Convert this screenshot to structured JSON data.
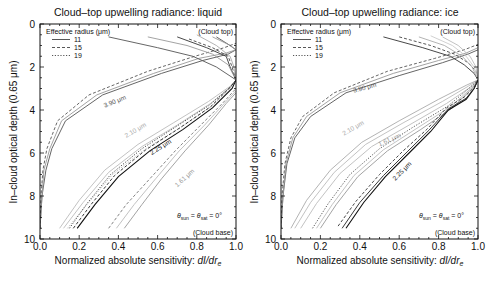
{
  "chart_data": [
    {
      "type": "line",
      "title": "Cloud–top upwelling radiance: liquid",
      "xlabel": "Normalized absolute sensitivity: dI/dr",
      "xlabel_italic_suffix": "dI/dr",
      "xlabel_subscript": "e",
      "ylabel": "In–cloud optical depth (0.65 μm)",
      "xlim": [
        0,
        1.0
      ],
      "ylim": [
        10,
        0
      ],
      "y_inverted": true,
      "xticks": [
        "0.0",
        "0.2",
        "0.4",
        "0.6",
        "0.8",
        "1.0"
      ],
      "yticks": [
        "0",
        "2",
        "4",
        "6",
        "8",
        "10"
      ],
      "grid": false,
      "legend": {
        "title": "Effective radius (μm)",
        "position": "upper-left",
        "entries": [
          {
            "label": "11",
            "style": "solid"
          },
          {
            "label": "15",
            "style": "dashed"
          },
          {
            "label": "19",
            "style": "dotted"
          }
        ]
      },
      "annotations": {
        "top": "(Cloud top)",
        "base": "(Cloud base)",
        "angle": "θsun = θsat = 0°"
      },
      "series": [
        {
          "name": "3.90 μm r=11",
          "color": "#555555",
          "style": "solid",
          "label": "3.90 μm",
          "label_pos": [
            0.33,
            3.9
          ],
          "label_rot": -22,
          "x": [
            0.0,
            0.01,
            0.03,
            0.06,
            0.13,
            0.32,
            0.62,
            0.83,
            0.96,
            1.0,
            0.97,
            0.9
          ],
          "y": [
            9.5,
            8.0,
            6.8,
            5.8,
            4.5,
            3.3,
            2.3,
            1.7,
            1.4,
            1.2,
            1.0,
            0.6
          ]
        },
        {
          "name": "3.90 μm r=15",
          "color": "#999999",
          "style": "solid",
          "x": [
            0.0,
            0.01,
            0.02,
            0.05,
            0.11,
            0.29,
            0.58,
            0.81,
            0.95,
            1.0,
            0.96,
            0.88
          ],
          "y": [
            9.5,
            8.0,
            6.8,
            5.8,
            4.5,
            3.3,
            2.3,
            1.6,
            1.35,
            1.2,
            0.95,
            0.6
          ]
        },
        {
          "name": "3.90 μm r=19",
          "color": "#555555",
          "style": "dashed",
          "x": [
            0.0,
            0.005,
            0.015,
            0.035,
            0.09,
            0.25,
            0.55,
            0.79,
            0.94,
            1.0
          ],
          "y": [
            9.5,
            8.0,
            6.8,
            5.8,
            4.5,
            3.3,
            2.2,
            1.5,
            1.1,
            0.9
          ]
        },
        {
          "name": "2.10 μm r=11",
          "color": "#bbbbbb",
          "style": "solid",
          "label": "2.10 μm",
          "label_pos": [
            0.44,
            5.3
          ],
          "label_rot": -30,
          "x": [
            0.1,
            0.2,
            0.33,
            0.5,
            0.68,
            0.86,
            0.97,
            1.0
          ],
          "y": [
            9.5,
            8.2,
            6.8,
            5.6,
            4.6,
            3.6,
            2.9,
            2.6
          ]
        },
        {
          "name": "2.10 μm r=15",
          "color": "#bbbbbb",
          "style": "solid",
          "x": [
            0.12,
            0.22,
            0.35,
            0.52,
            0.7,
            0.87,
            0.97,
            1.0
          ],
          "y": [
            9.5,
            8.3,
            6.9,
            5.7,
            4.7,
            3.7,
            2.95,
            2.6
          ]
        },
        {
          "name": "2.10 μm r=19",
          "color": "#aaaaaa",
          "style": "dotted",
          "x": [
            0.14,
            0.24,
            0.37,
            0.54,
            0.72,
            0.88,
            0.97,
            1.0
          ],
          "y": [
            9.5,
            8.4,
            7.0,
            5.8,
            4.8,
            3.8,
            3.0,
            2.6
          ]
        },
        {
          "name": "2.25 μm r=11",
          "color": "#111111",
          "style": "solid",
          "label": "2.25 μm",
          "label_pos": [
            0.57,
            6.1
          ],
          "label_rot": -32,
          "x": [
            0.19,
            0.28,
            0.4,
            0.56,
            0.73,
            0.88,
            0.98,
            1.0
          ],
          "y": [
            9.5,
            8.4,
            7.1,
            5.9,
            4.9,
            3.9,
            3.0,
            2.6
          ]
        },
        {
          "name": "2.25 μm r=15",
          "color": "#222222",
          "style": "dashed",
          "x": [
            0.17,
            0.26,
            0.38,
            0.54,
            0.71,
            0.87,
            0.97,
            1.0
          ],
          "y": [
            9.5,
            8.4,
            7.05,
            5.85,
            4.85,
            3.85,
            2.95,
            2.6
          ]
        },
        {
          "name": "2.25 μm r=19",
          "color": "#333333",
          "style": "dotted",
          "x": [
            0.15,
            0.24,
            0.36,
            0.52,
            0.69,
            0.86,
            0.97,
            1.0
          ],
          "y": [
            9.5,
            8.35,
            7.0,
            5.8,
            4.8,
            3.8,
            2.95,
            2.6
          ]
        },
        {
          "name": "1.61 μm r=11",
          "color": "#999999",
          "style": "solid",
          "label": "1.61 μm",
          "label_pos": [
            0.7,
            7.6
          ],
          "label_rot": -42,
          "x": [
            0.43,
            0.52,
            0.62,
            0.74,
            0.86,
            0.95,
            1.0
          ],
          "y": [
            9.5,
            8.4,
            7.2,
            5.9,
            4.7,
            3.7,
            3.2
          ]
        },
        {
          "name": "1.61 μm r=15",
          "color": "#bbbbbb",
          "style": "solid",
          "x": [
            0.39,
            0.48,
            0.59,
            0.71,
            0.84,
            0.94,
            1.0
          ],
          "y": [
            9.5,
            8.4,
            7.2,
            5.9,
            4.7,
            3.7,
            3.1
          ]
        },
        {
          "name": "1.61 μm r=19",
          "color": "#777777",
          "style": "dashed",
          "x": [
            0.35,
            0.44,
            0.56,
            0.69,
            0.82,
            0.93,
            1.0
          ],
          "y": [
            9.5,
            8.4,
            7.2,
            5.9,
            4.7,
            3.7,
            3.0
          ]
        },
        {
          "name": "0.86 top r=11",
          "color": "#333333",
          "style": "solid",
          "x": [
            0.7,
            0.85,
            0.95,
            0.97,
            1.0
          ],
          "y": [
            0.6,
            1.1,
            1.5,
            2.0,
            2.6
          ]
        },
        {
          "name": "0.86 top r=15",
          "color": "#444444",
          "style": "dashed",
          "x": [
            0.76,
            0.88,
            0.96,
            0.98,
            1.0
          ],
          "y": [
            0.7,
            1.1,
            1.5,
            2.0,
            2.6
          ]
        },
        {
          "name": "0.86 top r=19",
          "color": "#aaaaaa",
          "style": "solid",
          "x": [
            0.8,
            0.9,
            0.97,
            0.99,
            1.0
          ],
          "y": [
            0.5,
            1.0,
            1.5,
            2.0,
            2.6
          ]
        },
        {
          "name": "3.90 top cross",
          "color": "#555555",
          "style": "solid",
          "x": [
            0.35,
            0.6,
            0.78,
            0.9,
            1.0
          ],
          "y": [
            0.6,
            1.1,
            1.5,
            2.0,
            2.6
          ]
        },
        {
          "name": "3.90 top cross 2",
          "color": "#999999",
          "style": "solid",
          "x": [
            0.55,
            0.75,
            0.88,
            0.96,
            1.0
          ],
          "y": [
            0.6,
            1.0,
            1.4,
            1.9,
            2.6
          ]
        }
      ]
    },
    {
      "type": "line",
      "title": "Cloud–top upwelling radiance: ice",
      "xlabel": "Normalized absolute sensitivity: dI/dr",
      "xlabel_italic_suffix": "dI/dr",
      "xlabel_subscript": "e",
      "ylabel": "In–cloud optical depth (0.65 μm)",
      "xlim": [
        0,
        1.0
      ],
      "ylim": [
        10,
        0
      ],
      "y_inverted": true,
      "xticks": [
        "0.0",
        "0.2",
        "0.4",
        "0.6",
        "0.8",
        "1.0"
      ],
      "yticks": [
        "0",
        "2",
        "4",
        "6",
        "8",
        "10"
      ],
      "grid": false,
      "legend": {
        "title": "Effective radius (μm)",
        "position": "upper-left",
        "entries": [
          {
            "label": "11",
            "style": "solid"
          },
          {
            "label": "15",
            "style": "dashed"
          },
          {
            "label": "19",
            "style": "dotted"
          }
        ]
      },
      "annotations": {
        "top": "(Cloud top)",
        "base": "(Cloud base)",
        "angle": "θsun = θsat = 0°"
      },
      "series": [
        {
          "name": "3.90 μm r=11",
          "color": "#555555",
          "style": "solid",
          "label": "3.90 μm",
          "label_pos": [
            0.37,
            3.2
          ],
          "label_rot": -15,
          "x": [
            0.0,
            0.01,
            0.03,
            0.07,
            0.15,
            0.33,
            0.6,
            0.82,
            0.95,
            1.0
          ],
          "y": [
            9.5,
            8.0,
            6.5,
            5.3,
            4.3,
            3.2,
            2.4,
            1.8,
            1.4,
            1.2
          ]
        },
        {
          "name": "3.90 μm r=15",
          "color": "#999999",
          "style": "solid",
          "x": [
            0.0,
            0.01,
            0.025,
            0.06,
            0.13,
            0.3,
            0.57,
            0.8,
            0.94,
            1.0
          ],
          "y": [
            9.5,
            8.0,
            6.5,
            5.3,
            4.3,
            3.2,
            2.3,
            1.7,
            1.35,
            1.1
          ]
        },
        {
          "name": "3.90 μm r=19",
          "color": "#555555",
          "style": "dashed",
          "x": [
            0.0,
            0.005,
            0.02,
            0.05,
            0.11,
            0.27,
            0.54,
            0.78,
            0.93,
            1.0
          ],
          "y": [
            9.5,
            8.0,
            6.5,
            5.3,
            4.3,
            3.2,
            2.2,
            1.6,
            1.2,
            0.95
          ]
        },
        {
          "name": "2.10 μm r=11",
          "color": "#bbbbbb",
          "style": "solid",
          "label": "2.10 μm",
          "label_pos": [
            0.32,
            5.2
          ],
          "label_rot": -30,
          "x": [
            0.07,
            0.15,
            0.27,
            0.43,
            0.62,
            0.82,
            0.95,
            1.0
          ],
          "y": [
            9.5,
            8.3,
            6.9,
            5.6,
            4.6,
            3.6,
            2.9,
            2.6
          ]
        },
        {
          "name": "2.10 μm r=15",
          "color": "#bbbbbb",
          "style": "solid",
          "x": [
            0.1,
            0.18,
            0.3,
            0.46,
            0.65,
            0.84,
            0.96,
            1.0
          ],
          "y": [
            9.5,
            8.35,
            6.95,
            5.7,
            4.7,
            3.7,
            2.95,
            2.6
          ]
        },
        {
          "name": "2.10 μm r=19",
          "color": "#aaaaaa",
          "style": "solid",
          "x": [
            0.05,
            0.13,
            0.25,
            0.41,
            0.6,
            0.8,
            0.94,
            1.0
          ],
          "y": [
            9.5,
            8.2,
            6.8,
            5.5,
            4.5,
            3.5,
            2.85,
            2.6
          ]
        },
        {
          "name": "1.61 μm r=11",
          "color": "#999999",
          "style": "solid",
          "label": "1.61 μm",
          "label_pos": [
            0.5,
            5.7
          ],
          "label_rot": -24,
          "x": [
            0.2,
            0.28,
            0.39,
            0.54,
            0.71,
            0.87,
            0.97,
            1.0
          ],
          "y": [
            9.5,
            8.4,
            7.1,
            5.9,
            4.9,
            3.9,
            3.0,
            2.6
          ]
        },
        {
          "name": "1.61 μm r=15",
          "color": "#bbbbbb",
          "style": "solid",
          "x": [
            0.18,
            0.26,
            0.37,
            0.52,
            0.69,
            0.86,
            0.97,
            1.0
          ],
          "y": [
            9.5,
            8.4,
            7.05,
            5.85,
            4.85,
            3.85,
            2.95,
            2.6
          ]
        },
        {
          "name": "1.61 μm r=19",
          "color": "#444444",
          "style": "dotted",
          "x": [
            0.16,
            0.24,
            0.35,
            0.5,
            0.67,
            0.85,
            0.96,
            1.0
          ],
          "y": [
            9.5,
            8.35,
            7.0,
            5.8,
            4.8,
            3.8,
            2.95,
            2.6
          ]
        },
        {
          "name": "2.25 μm r=11",
          "color": "#111111",
          "style": "solid",
          "label": "2.25 μm",
          "label_pos": [
            0.58,
            7.3
          ],
          "label_rot": -45,
          "x": [
            0.33,
            0.42,
            0.53,
            0.65,
            0.76,
            0.85,
            0.94,
            0.98,
            1.0
          ],
          "y": [
            9.5,
            8.3,
            7.1,
            6.0,
            5.0,
            4.0,
            3.5,
            3.0,
            2.6
          ]
        },
        {
          "name": "2.25 μm r=15",
          "color": "#222222",
          "style": "solid",
          "x": [
            0.31,
            0.4,
            0.52,
            0.64,
            0.75,
            0.85,
            0.94,
            0.98,
            1.0
          ],
          "y": [
            9.5,
            8.3,
            7.05,
            5.95,
            4.95,
            3.95,
            3.45,
            3.0,
            2.6
          ]
        },
        {
          "name": "2.25 μm r=19",
          "color": "#333333",
          "style": "dashed",
          "x": [
            0.29,
            0.38,
            0.5,
            0.62,
            0.74,
            0.84,
            0.93,
            0.98,
            1.0
          ],
          "y": [
            9.4,
            8.25,
            7.0,
            5.9,
            4.9,
            3.9,
            3.4,
            2.95,
            2.6
          ]
        },
        {
          "name": "top cross dark",
          "color": "#333333",
          "style": "solid",
          "x": [
            0.52,
            0.72,
            0.86,
            0.93,
            0.98,
            1.0
          ],
          "y": [
            0.6,
            1.1,
            1.5,
            1.9,
            2.3,
            2.6
          ]
        },
        {
          "name": "top cross dashed",
          "color": "#444444",
          "style": "dashed",
          "x": [
            0.6,
            0.76,
            0.88,
            0.95,
            0.99,
            1.0
          ],
          "y": [
            0.6,
            1.0,
            1.4,
            1.8,
            2.2,
            2.6
          ]
        },
        {
          "name": "top cross light 1",
          "color": "#aaaaaa",
          "style": "solid",
          "x": [
            0.7,
            0.83,
            0.92,
            0.97,
            1.0
          ],
          "y": [
            0.6,
            1.0,
            1.5,
            2.0,
            2.6
          ]
        },
        {
          "name": "top cross light 2",
          "color": "#cccccc",
          "style": "solid",
          "x": [
            0.76,
            0.87,
            0.94,
            0.98,
            1.0
          ],
          "y": [
            0.55,
            1.0,
            1.5,
            2.0,
            2.6
          ]
        },
        {
          "name": "top cross light 3",
          "color": "#bbbbbb",
          "style": "solid",
          "x": [
            0.82,
            0.9,
            0.96,
            0.99,
            1.0
          ],
          "y": [
            0.6,
            1.0,
            1.5,
            2.0,
            2.6
          ]
        }
      ]
    }
  ],
  "panels": [
    {
      "title": "Cloud–top upwelling radiance: liquid"
    },
    {
      "title": "Cloud–top upwelling radiance: ice"
    }
  ]
}
